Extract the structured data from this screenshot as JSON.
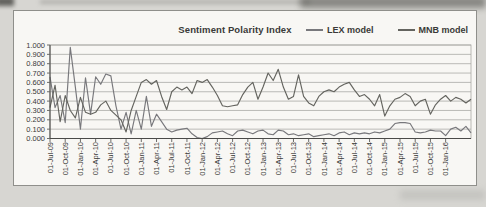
{
  "page": {
    "background_color": "#d7d6d2",
    "frame_border_color": "#8f8f8b",
    "plot_background": "#f8f7f4",
    "grid_color": "#aaaaa6",
    "axis_color": "#4a4a48",
    "text_color": "#3a3a38"
  },
  "chart_data": {
    "type": "line",
    "title": "Sentiment Polarity Index",
    "xlabel": "",
    "ylabel": "",
    "ylim": [
      0,
      1
    ],
    "grid": true,
    "legend_position": "top-right",
    "y_tick_labels": [
      "1.000",
      "0.900",
      "0.800",
      "0.700",
      "0.600",
      "0.500",
      "0.400",
      "0.300",
      "0.200",
      "0.100",
      "0.000"
    ],
    "x_tick_labels": [
      "01-Jul-09",
      "01-Oct-09",
      "01-Jan-10",
      "01-Apr-10",
      "01-Jul-10",
      "01-Oct-10",
      "01-Jan-11",
      "01-Apr-11",
      "01-Jul-11",
      "01-Oct-11",
      "01-Jan-12",
      "01-Apr-12",
      "01-Jul-12",
      "01-Oct-12",
      "01-Jan-13",
      "01-Apr-13",
      "01-Jul-13",
      "01-Oct-13",
      "01-Jan-14",
      "01-Apr-14",
      "01-Jul-14",
      "01-Oct-14",
      "01-Jan-15",
      "01-Apr-15",
      "01-Jul-15",
      "01-Oct-15",
      "01-Jan-16"
    ],
    "x_note": "monthly points, Jul-2009 through Jun-2016, tick labels every 3rd month",
    "tick_label_every_n_points": 3,
    "series": [
      {
        "name": "LEX model",
        "color": "#78787c",
        "values": [
          0.66,
          0.33,
          0.46,
          0.17,
          0.975,
          0.55,
          0.1,
          0.65,
          0.26,
          0.66,
          0.58,
          0.69,
          0.67,
          0.35,
          0.1,
          0.28,
          0.05,
          0.3,
          0.1,
          0.45,
          0.13,
          0.26,
          0.18,
          0.1,
          0.07,
          0.09,
          0.1,
          0.11,
          0.05,
          0.01,
          0.0,
          0.02,
          0.06,
          0.07,
          0.08,
          0.05,
          0.03,
          0.08,
          0.09,
          0.07,
          0.05,
          0.08,
          0.09,
          0.05,
          0.04,
          0.09,
          0.08,
          0.04,
          0.05,
          0.03,
          0.04,
          0.05,
          0.02,
          0.03,
          0.04,
          0.05,
          0.03,
          0.06,
          0.07,
          0.04,
          0.06,
          0.05,
          0.06,
          0.05,
          0.07,
          0.06,
          0.08,
          0.1,
          0.16,
          0.17,
          0.17,
          0.16,
          0.07,
          0.06,
          0.07,
          0.09,
          0.08,
          0.08,
          0.03,
          0.1,
          0.12,
          0.08,
          0.13,
          0.06
        ]
      },
      {
        "name": "MNB model",
        "color": "#64645f",
        "values": [
          0.33,
          0.57,
          0.18,
          0.46,
          0.3,
          0.22,
          0.44,
          0.28,
          0.26,
          0.28,
          0.36,
          0.4,
          0.3,
          0.25,
          0.2,
          0.07,
          0.3,
          0.45,
          0.6,
          0.63,
          0.58,
          0.62,
          0.45,
          0.31,
          0.5,
          0.55,
          0.52,
          0.55,
          0.48,
          0.62,
          0.6,
          0.63,
          0.55,
          0.46,
          0.35,
          0.34,
          0.35,
          0.36,
          0.47,
          0.55,
          0.6,
          0.42,
          0.55,
          0.7,
          0.62,
          0.74,
          0.55,
          0.42,
          0.45,
          0.68,
          0.45,
          0.38,
          0.35,
          0.45,
          0.5,
          0.52,
          0.5,
          0.55,
          0.58,
          0.6,
          0.52,
          0.45,
          0.47,
          0.42,
          0.35,
          0.47,
          0.24,
          0.35,
          0.42,
          0.44,
          0.48,
          0.45,
          0.35,
          0.4,
          0.42,
          0.26,
          0.36,
          0.42,
          0.46,
          0.4,
          0.44,
          0.42,
          0.38,
          0.42
        ]
      }
    ]
  }
}
